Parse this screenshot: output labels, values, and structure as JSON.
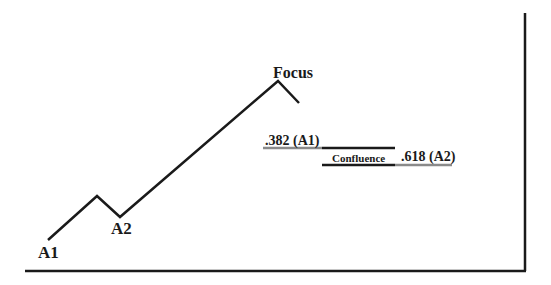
{
  "diagram": {
    "labels": {
      "a1": "A1",
      "a2": "A2",
      "focus": "Focus",
      "fib_382": ".382 (A1)",
      "fib_618": ".618 (A2)",
      "confluence": "Confluence"
    },
    "colors": {
      "line": "#1a1a1a",
      "grey_line": "#8a8a8a",
      "background": "#ffffff"
    }
  }
}
